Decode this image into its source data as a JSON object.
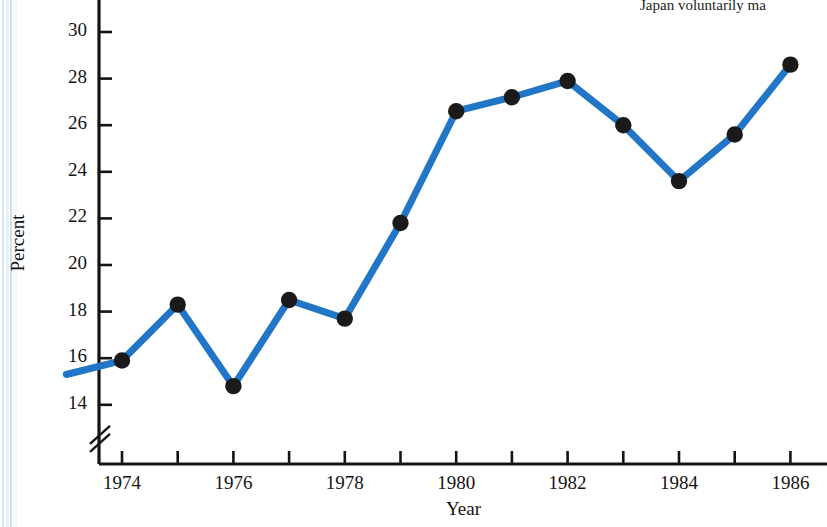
{
  "figure": {
    "caption_top_right": "Japan voluntarily ma",
    "line_color": "#2176c7",
    "marker_color": "#1a1a1a",
    "axis_color": "#161314",
    "background": "#ffffff"
  },
  "chart_data": {
    "type": "line",
    "title": "",
    "subtitle": "",
    "xlabel": "Year",
    "ylabel": "Percent",
    "grid": false,
    "legend": "none",
    "xlim": [
      1973,
      1986
    ],
    "ylim": [
      13,
      31
    ],
    "y_axis_break": true,
    "y_axis_break_symbol": "//",
    "xticks": [
      1974,
      1975,
      1976,
      1977,
      1978,
      1979,
      1980,
      1981,
      1982,
      1983,
      1984,
      1985,
      1986
    ],
    "xtick_labels": [
      "1974",
      "",
      "1976",
      "",
      "1978",
      "",
      "1980",
      "",
      "1982",
      "",
      "1984",
      "",
      "1986"
    ],
    "yticks": [
      14,
      16,
      18,
      20,
      22,
      24,
      26,
      28,
      30
    ],
    "ytick_labels": [
      "14",
      "16",
      "18",
      "20",
      "22",
      "24",
      "26",
      "28",
      "30"
    ],
    "x": [
      1973,
      1974,
      1975,
      1976,
      1977,
      1978,
      1979,
      1980,
      1981,
      1982,
      1983,
      1984,
      1985,
      1986
    ],
    "y": [
      15.3,
      15.9,
      18.3,
      14.8,
      18.5,
      17.7,
      21.8,
      26.6,
      27.2,
      27.9,
      26.0,
      23.6,
      25.6,
      28.6
    ],
    "markers_shown_at_x": [
      1974,
      1975,
      1976,
      1977,
      1978,
      1979,
      1980,
      1981,
      1982,
      1983,
      1984,
      1985,
      1986
    ],
    "series": [
      {
        "name": "Percent",
        "points": [
          {
            "x": 1973,
            "y": 15.3,
            "marker": false
          },
          {
            "x": 1974,
            "y": 15.9,
            "marker": true
          },
          {
            "x": 1975,
            "y": 18.3,
            "marker": true
          },
          {
            "x": 1976,
            "y": 14.8,
            "marker": true
          },
          {
            "x": 1977,
            "y": 18.5,
            "marker": true
          },
          {
            "x": 1978,
            "y": 17.7,
            "marker": true
          },
          {
            "x": 1979,
            "y": 21.8,
            "marker": true
          },
          {
            "x": 1980,
            "y": 26.6,
            "marker": true
          },
          {
            "x": 1981,
            "y": 27.2,
            "marker": true
          },
          {
            "x": 1982,
            "y": 27.9,
            "marker": true
          },
          {
            "x": 1983,
            "y": 26.0,
            "marker": true
          },
          {
            "x": 1984,
            "y": 23.6,
            "marker": true
          },
          {
            "x": 1985,
            "y": 25.6,
            "marker": true
          },
          {
            "x": 1986,
            "y": 28.6,
            "marker": true
          }
        ]
      }
    ]
  }
}
